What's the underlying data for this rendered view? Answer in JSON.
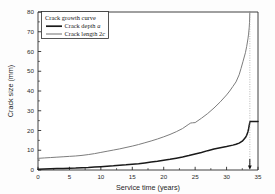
{
  "chart_data": {
    "type": "line",
    "title": "Crack growth curve",
    "xlabel": "Service time (years)",
    "ylabel": "Crack size (mm)",
    "xlim": [
      0,
      35
    ],
    "ylim": [
      0,
      80
    ],
    "xticks": [
      0,
      5,
      10,
      15,
      20,
      25,
      30,
      35
    ],
    "yticks": [
      0,
      10,
      20,
      30,
      40,
      50,
      60,
      70,
      80
    ],
    "xtick_labels": [
      "0",
      "5",
      "10",
      "15",
      "20",
      "25",
      "30",
      "35"
    ],
    "ytick_labels": [
      "0",
      "10",
      "20",
      "30",
      "40",
      "50",
      "60",
      "70",
      "80"
    ],
    "grid": false,
    "legend_position": "upper-left",
    "legend_title": "Crack growth curve",
    "annotation": {
      "marker": "failure-arrow",
      "x": 33.7,
      "label": ""
    },
    "series": [
      {
        "name": "Crack depth a",
        "color": "#1a1a1a",
        "linewidth": 1.5,
        "x": [
          0,
          1,
          2,
          3,
          4,
          5,
          6,
          7,
          8,
          9,
          10,
          11,
          12,
          13,
          14,
          15,
          16,
          17,
          18,
          19,
          20,
          21,
          22,
          23,
          24,
          25,
          26,
          27,
          28,
          29,
          30,
          31,
          31.5,
          32,
          32.5,
          33,
          33.2,
          33.4,
          33.5,
          33.6,
          33.65,
          33.7,
          33.75,
          34.4,
          35
        ],
        "y": [
          0.4,
          0.5,
          0.6,
          0.7,
          0.8,
          0.9,
          1.0,
          1.2,
          1.3,
          1.5,
          1.7,
          1.9,
          2.1,
          2.4,
          2.6,
          2.9,
          3.2,
          3.6,
          4.0,
          4.4,
          4.9,
          5.4,
          6.0,
          6.6,
          7.3,
          8.1,
          8.9,
          9.8,
          10.6,
          11.3,
          11.9,
          12.6,
          13.0,
          13.6,
          14.6,
          16.4,
          17.6,
          19.4,
          20.8,
          22.4,
          23.4,
          24.2,
          24.5,
          24.5,
          24.5
        ]
      },
      {
        "name": "Crack length 2c",
        "color": "#7d7d7d",
        "linewidth": 1.0,
        "x": [
          0,
          1,
          2,
          3,
          4,
          5,
          6,
          7,
          8,
          9,
          10,
          11,
          12,
          13,
          14,
          15,
          16,
          17,
          18,
          19,
          20,
          21,
          22,
          23,
          24,
          24.3,
          24.6,
          25,
          26,
          27,
          28,
          29,
          30,
          30.5,
          31,
          31.5,
          32,
          32.3,
          32.6,
          33,
          33.2,
          33.4,
          33.5,
          33.6,
          33.65,
          33.7
        ],
        "y": [
          5.9,
          6.1,
          6.3,
          6.5,
          6.7,
          6.9,
          7.1,
          7.4,
          7.8,
          8.3,
          8.9,
          9.5,
          10.1,
          10.7,
          11.4,
          12.1,
          12.9,
          13.8,
          14.7,
          15.7,
          16.8,
          18.0,
          19.4,
          21.0,
          23.2,
          23.8,
          23.9,
          24.0,
          26.2,
          28.6,
          31.4,
          34.5,
          38.0,
          40.0,
          42.3,
          44.6,
          48.2,
          51.4,
          54.8,
          59.4,
          62.6,
          66.4,
          68.8,
          72.0,
          74.6,
          80.0
        ]
      }
    ]
  },
  "legend": {
    "title": "Crack growth curve",
    "entries": [
      {
        "label_main": "Crack depth ",
        "label_italic": "a",
        "color": "#1a1a1a",
        "linewidth": 1.6
      },
      {
        "label_main": "Crack length 2",
        "label_italic": "c",
        "color": "#7d7d7d",
        "linewidth": 1.0
      }
    ]
  }
}
